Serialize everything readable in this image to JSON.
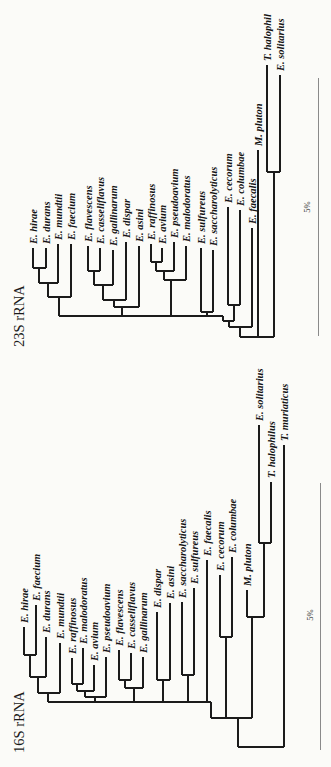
{
  "figure": {
    "width": 331,
    "height": 767,
    "background": "#fbfbf8",
    "line_color": "#1b1b1b",
    "scale_bar_color": "#8a8a8a"
  },
  "chart_data": [
    {
      "type": "phylogenetic-tree",
      "title": "23S rRNA",
      "orientation": "rotated-90ccw-tips-up",
      "scale_bar": {
        "label": "5%",
        "x": 318,
        "y1": 78,
        "y2": 336,
        "label_x": 310,
        "label_y": 207
      },
      "tips": [
        {
          "label": "E. hirae",
          "x": 33,
          "y": 248
        },
        {
          "label": "E. durans",
          "x": 46,
          "y": 248
        },
        {
          "label": "E. mundtii",
          "x": 58,
          "y": 244
        },
        {
          "label": "E. faecium",
          "x": 71,
          "y": 244
        },
        {
          "label": "E. flavescens",
          "x": 88,
          "y": 246
        },
        {
          "label": "E. casseliflavus",
          "x": 100,
          "y": 248
        },
        {
          "label": "E. gallinarum",
          "x": 113,
          "y": 250
        },
        {
          "label": "E. dispar",
          "x": 126,
          "y": 242
        },
        {
          "label": "E. asini",
          "x": 139,
          "y": 246
        },
        {
          "label": "E. raffinosus",
          "x": 151,
          "y": 244
        },
        {
          "label": "E. avium",
          "x": 162,
          "y": 248
        },
        {
          "label": "E. pseudoavium",
          "x": 174,
          "y": 242
        },
        {
          "label": "E. malodoratus",
          "x": 186,
          "y": 246
        },
        {
          "label": "E. sulfureus",
          "x": 201,
          "y": 248
        },
        {
          "label": "E. saccharolyticus",
          "x": 213,
          "y": 250
        },
        {
          "label": "E. cecorum",
          "x": 228,
          "y": 207
        },
        {
          "label": "E. columbae",
          "x": 240,
          "y": 210
        },
        {
          "label": "E. faecalis",
          "x": 252,
          "y": 228
        },
        {
          "label": "M. pluton",
          "x": 258,
          "y": 150
        },
        {
          "label": "T. halophil",
          "x": 267,
          "y": 65
        },
        {
          "label": "E. solitarius",
          "x": 280,
          "y": 75
        }
      ],
      "branches": [
        [
          33,
          248,
          33,
          268
        ],
        [
          46,
          248,
          46,
          268
        ],
        [
          33,
          268,
          46,
          268
        ],
        [
          39,
          268,
          39,
          283
        ],
        [
          58,
          244,
          58,
          283
        ],
        [
          39,
          283,
          58,
          283
        ],
        [
          48,
          283,
          48,
          297
        ],
        [
          71,
          244,
          71,
          297
        ],
        [
          48,
          297,
          71,
          297
        ],
        [
          59,
          297,
          59,
          316
        ],
        [
          88,
          246,
          88,
          271
        ],
        [
          100,
          248,
          100,
          271
        ],
        [
          88,
          271,
          100,
          271
        ],
        [
          94,
          271,
          94,
          285
        ],
        [
          113,
          250,
          113,
          285
        ],
        [
          94,
          285,
          113,
          285
        ],
        [
          103,
          285,
          103,
          300
        ],
        [
          126,
          242,
          126,
          300
        ],
        [
          103,
          300,
          126,
          300
        ],
        [
          114,
          300,
          114,
          307
        ],
        [
          139,
          246,
          139,
          307
        ],
        [
          114,
          307,
          139,
          307
        ],
        [
          122,
          307,
          122,
          316
        ],
        [
          151,
          244,
          151,
          262
        ],
        [
          162,
          248,
          162,
          262
        ],
        [
          151,
          262,
          162,
          262
        ],
        [
          156,
          262,
          156,
          271
        ],
        [
          174,
          242,
          174,
          271
        ],
        [
          156,
          271,
          174,
          271
        ],
        [
          164,
          271,
          164,
          280
        ],
        [
          186,
          246,
          186,
          280
        ],
        [
          164,
          280,
          186,
          280
        ],
        [
          171,
          280,
          171,
          316
        ],
        [
          201,
          248,
          201,
          312
        ],
        [
          213,
          250,
          213,
          312
        ],
        [
          201,
          312,
          213,
          312
        ],
        [
          207,
          312,
          207,
          316
        ],
        [
          59,
          316,
          223,
          316
        ],
        [
          223,
          316,
          223,
          321
        ],
        [
          228,
          207,
          228,
          305
        ],
        [
          240,
          210,
          240,
          305
        ],
        [
          228,
          305,
          240,
          305
        ],
        [
          234,
          305,
          234,
          321
        ],
        [
          223,
          321,
          234,
          321
        ],
        [
          229,
          321,
          229,
          327
        ],
        [
          252,
          228,
          252,
          327
        ],
        [
          229,
          327,
          252,
          327
        ],
        [
          240,
          327,
          240,
          337
        ],
        [
          258,
          150,
          258,
          337
        ],
        [
          267,
          65,
          267,
          172
        ],
        [
          280,
          75,
          280,
          172
        ],
        [
          267,
          172,
          280,
          172
        ],
        [
          274,
          172,
          274,
          337
        ],
        [
          240,
          337,
          274,
          337
        ]
      ]
    },
    {
      "type": "phylogenetic-tree",
      "title": "16S rRNA",
      "orientation": "rotated-90ccw-tips-up",
      "scale_bar": {
        "label": "5%",
        "x": 320,
        "y1": 483,
        "y2": 750,
        "label_x": 313,
        "label_y": 615
      },
      "tips": [
        {
          "label": "E. hirae",
          "x": 24,
          "y": 627
        },
        {
          "label": "E. faecium",
          "x": 36,
          "y": 605
        },
        {
          "label": "E. durans",
          "x": 46,
          "y": 637
        },
        {
          "label": "E. mundtii",
          "x": 60,
          "y": 643
        },
        {
          "label": "E. raffinosus",
          "x": 72,
          "y": 658
        },
        {
          "label": "E. malodoratus",
          "x": 83,
          "y": 648
        },
        {
          "label": "E. avium",
          "x": 94,
          "y": 665
        },
        {
          "label": "E. pseudoavium",
          "x": 106,
          "y": 657
        },
        {
          "label": "E. flavescens",
          "x": 119,
          "y": 650
        },
        {
          "label": "E. casseliflavus",
          "x": 131,
          "y": 653
        },
        {
          "label": "E. gallinarum",
          "x": 143,
          "y": 657
        },
        {
          "label": "E. dispar",
          "x": 157,
          "y": 612
        },
        {
          "label": "E. asini",
          "x": 170,
          "y": 603
        },
        {
          "label": "E. saccharolyticus",
          "x": 182,
          "y": 602
        },
        {
          "label": "E. sulfureus",
          "x": 194,
          "y": 588
        },
        {
          "label": "E. faecalis",
          "x": 207,
          "y": 560
        },
        {
          "label": "E. cecorum",
          "x": 220,
          "y": 575
        },
        {
          "label": "E. columbae",
          "x": 232,
          "y": 557
        },
        {
          "label": "M. pluton",
          "x": 247,
          "y": 590
        },
        {
          "label": "E. solitarius",
          "x": 259,
          "y": 425
        },
        {
          "label": "T. halophilus",
          "x": 271,
          "y": 482
        },
        {
          "label": "T. muriaticus",
          "x": 284,
          "y": 445
        }
      ],
      "branches": [
        [
          24,
          627,
          24,
          655
        ],
        [
          36,
          605,
          36,
          655
        ],
        [
          24,
          655,
          36,
          655
        ],
        [
          30,
          655,
          30,
          677
        ],
        [
          46,
          637,
          46,
          677
        ],
        [
          30,
          677,
          46,
          677
        ],
        [
          38,
          677,
          38,
          693
        ],
        [
          60,
          643,
          60,
          693
        ],
        [
          38,
          693,
          60,
          693
        ],
        [
          48,
          693,
          48,
          702
        ],
        [
          72,
          658,
          72,
          684
        ],
        [
          83,
          648,
          83,
          684
        ],
        [
          72,
          684,
          83,
          684
        ],
        [
          77,
          684,
          77,
          691
        ],
        [
          94,
          665,
          94,
          691
        ],
        [
          77,
          691,
          94,
          691
        ],
        [
          85,
          691,
          85,
          697
        ],
        [
          106,
          657,
          106,
          697
        ],
        [
          85,
          697,
          106,
          697
        ],
        [
          95,
          697,
          95,
          702
        ],
        [
          119,
          650,
          119,
          680
        ],
        [
          131,
          653,
          131,
          680
        ],
        [
          119,
          680,
          131,
          680
        ],
        [
          125,
          680,
          125,
          688
        ],
        [
          143,
          657,
          143,
          688
        ],
        [
          125,
          688,
          143,
          688
        ],
        [
          134,
          688,
          134,
          702
        ],
        [
          157,
          612,
          157,
          680
        ],
        [
          170,
          603,
          170,
          680
        ],
        [
          157,
          680,
          170,
          680
        ],
        [
          163,
          680,
          163,
          702
        ],
        [
          182,
          602,
          182,
          675
        ],
        [
          194,
          588,
          194,
          675
        ],
        [
          182,
          675,
          194,
          675
        ],
        [
          188,
          675,
          188,
          702
        ],
        [
          207,
          560,
          207,
          702
        ],
        [
          48,
          702,
          211,
          702
        ],
        [
          211,
          702,
          211,
          718
        ],
        [
          220,
          575,
          220,
          637
        ],
        [
          232,
          557,
          232,
          637
        ],
        [
          220,
          637,
          232,
          637
        ],
        [
          226,
          637,
          226,
          718
        ],
        [
          211,
          718,
          252,
          718
        ],
        [
          247,
          590,
          247,
          617
        ],
        [
          259,
          425,
          259,
          543
        ],
        [
          271,
          482,
          271,
          543
        ],
        [
          259,
          543,
          271,
          543
        ],
        [
          264,
          543,
          264,
          617
        ],
        [
          247,
          617,
          264,
          617
        ],
        [
          252,
          617,
          252,
          718
        ],
        [
          238,
          718,
          238,
          747
        ],
        [
          284,
          445,
          284,
          747
        ],
        [
          238,
          747,
          284,
          747
        ]
      ]
    }
  ]
}
